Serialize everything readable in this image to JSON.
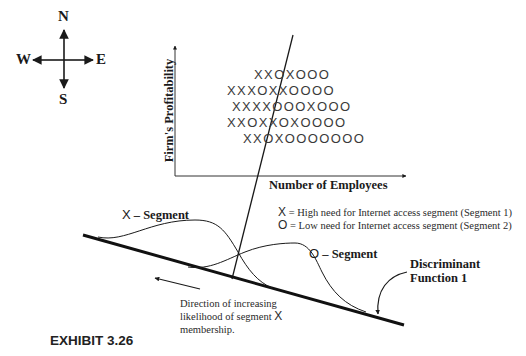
{
  "compass": {
    "north": "N",
    "south": "S",
    "east": "E",
    "west": "W"
  },
  "scatter": {
    "y_axis_label": "Firm's Profitability",
    "x_axis_label": "Number of Employees",
    "rows": [
      "XXOXOOO",
      "XXXOXXOOOO",
      "XXXXOOOXOOO",
      "XXOXXOXOOOO",
      "XXOXOOOOOOO"
    ]
  },
  "legend": {
    "items": [
      {
        "symbol": "X",
        "text": "= High need for Internet access segment (Segment 1)"
      },
      {
        "symbol": "O",
        "text": "= Low need for Internet access segment (Segment 2)"
      }
    ]
  },
  "curves": {
    "x_segment": {
      "symbol": "X",
      "label": "– Segment"
    },
    "o_segment": {
      "symbol": "O",
      "label": "– Segment"
    }
  },
  "discriminant": {
    "line1": "Discriminant",
    "line2": "Function 1"
  },
  "direction_note": {
    "text_before": "Direction of increasing likelihood of segment",
    "symbol": "X",
    "text_after": "membership."
  },
  "caption": "EXHIBIT 3.26"
}
